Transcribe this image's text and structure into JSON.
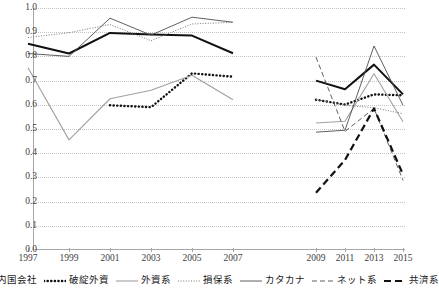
{
  "chart_data": {
    "type": "line",
    "title": "",
    "xlabel": "",
    "ylabel": "",
    "ylim": [
      0.0,
      1.0
    ],
    "ytick_labels": [
      "0.0",
      "0.1",
      "0.2",
      "0.3",
      "0.4",
      "0.5",
      "0.6",
      "0.7",
      "0.8",
      "0.9",
      "1.0"
    ],
    "ytick_values": [
      0.0,
      0.1,
      0.2,
      0.3,
      0.4,
      0.5,
      0.6,
      0.7,
      0.8,
      0.9,
      1.0
    ],
    "grid": true,
    "legend_position": "bottom",
    "categories": [
      "1997",
      "1999",
      "2001",
      "2003",
      "2005",
      "2007",
      "2009",
      "2011",
      "2013",
      "2015"
    ],
    "series": [
      {
        "name": "内国会社",
        "style": "solid-bold-black",
        "color": "#111111",
        "values": [
          0.852,
          0.812,
          0.897,
          0.89,
          0.886,
          0.813,
          0.7,
          0.664,
          0.766,
          0.643
        ]
      },
      {
        "name": "破綻外資",
        "style": "dotted-bold-black",
        "color": "#111111",
        "values": [
          null,
          null,
          0.598,
          0.59,
          0.73,
          0.716,
          0.621,
          0.601,
          0.643,
          0.639
        ]
      },
      {
        "name": "外資系",
        "style": "solid-gray",
        "color": "#a0a0a0",
        "values": [
          0.753,
          0.455,
          0.625,
          0.66,
          0.722,
          0.621,
          0.525,
          0.532,
          0.728,
          0.53
        ]
      },
      {
        "name": "損保系",
        "style": "dotted-fine-gray",
        "color": "#777777",
        "values": [
          0.878,
          0.898,
          0.932,
          0.865,
          0.934,
          0.941,
          0.622,
          0.598,
          0.588,
          0.563
        ]
      },
      {
        "name": "カタカナ",
        "style": "solid-thin-dark",
        "color": "#4d4d4d",
        "values": [
          0.812,
          0.8,
          0.958,
          0.888,
          0.962,
          0.941,
          0.487,
          0.495,
          0.843,
          0.598
        ]
      },
      {
        "name": "ネット系",
        "style": "dashed-thin-dark",
        "color": "#4d4d4d",
        "values": [
          null,
          null,
          null,
          null,
          null,
          null,
          0.797,
          0.49,
          0.585,
          0.288
        ]
      },
      {
        "name": "共済系",
        "style": "dashed-bold-black",
        "color": "#111111",
        "values": [
          null,
          null,
          null,
          null,
          null,
          null,
          0.237,
          0.372,
          0.585,
          0.312
        ]
      }
    ]
  },
  "legend": {
    "items": [
      {
        "label": "内国会社"
      },
      {
        "label": "破綻外資"
      },
      {
        "label": "外資系"
      },
      {
        "label": "損保系"
      },
      {
        "label": "カタカナ"
      },
      {
        "label": "ネット系"
      },
      {
        "label": "共済系"
      }
    ]
  },
  "axes": {
    "y_labels": [
      "1.0",
      "0.9",
      "0.8",
      "0.7",
      "0.6",
      "0.5",
      "0.4",
      "0.3",
      "0.2",
      "0.1",
      "0.0"
    ],
    "x_labels": [
      "1997",
      "1999",
      "2001",
      "2003",
      "2005",
      "2007",
      "2009",
      "2011",
      "2013",
      "2015"
    ]
  }
}
